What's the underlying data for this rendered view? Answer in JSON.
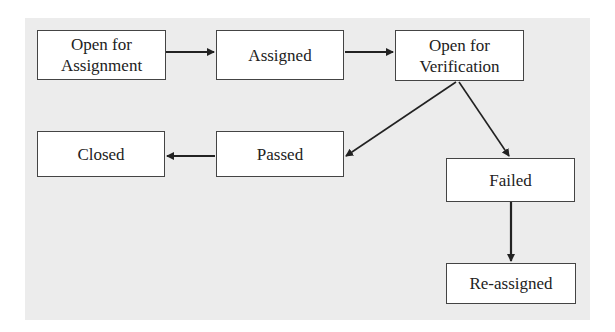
{
  "diagram": {
    "type": "state-flow",
    "nodes": [
      {
        "id": "open_for_assignment",
        "label_line1": "Open for",
        "label_line2": "Assignment"
      },
      {
        "id": "assigned",
        "label": "Assigned"
      },
      {
        "id": "open_for_verification",
        "label_line1": "Open for",
        "label_line2": "Verification"
      },
      {
        "id": "closed",
        "label": "Closed"
      },
      {
        "id": "passed",
        "label": "Passed"
      },
      {
        "id": "failed",
        "label": "Failed"
      },
      {
        "id": "reassigned",
        "label": "Re-assigned"
      }
    ],
    "edges": [
      {
        "from": "open_for_assignment",
        "to": "assigned"
      },
      {
        "from": "assigned",
        "to": "open_for_verification"
      },
      {
        "from": "open_for_verification",
        "to": "passed"
      },
      {
        "from": "open_for_verification",
        "to": "failed"
      },
      {
        "from": "passed",
        "to": "closed"
      },
      {
        "from": "failed",
        "to": "reassigned"
      }
    ],
    "colors": {
      "background": "#ececec",
      "node_fill": "#ffffff",
      "stroke": "#444444",
      "text": "#222222"
    }
  }
}
